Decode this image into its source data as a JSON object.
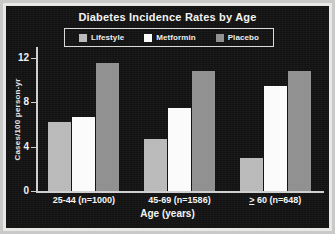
{
  "chart_data": {
    "type": "bar",
    "title": "Diabetes Incidence Rates by Age",
    "xlabel": "Age (years)",
    "ylabel": "Cases/100 person-yr",
    "categories": [
      "25-44 (n=1000)",
      "45-69 (n=1586)",
      "> 60 (n=648)"
    ],
    "series": [
      {
        "name": "Lifestyle",
        "color": "#b9b9b9",
        "values": [
          6.2,
          4.7,
          3.0
        ]
      },
      {
        "name": "Metformin",
        "color": "#fbfbfb",
        "values": [
          6.7,
          7.5,
          9.5
        ]
      },
      {
        "name": "Placebo",
        "color": "#8f8f8f",
        "values": [
          11.6,
          10.8,
          10.8
        ]
      }
    ],
    "ylim": [
      0,
      13
    ],
    "yticks": [
      0,
      4,
      8,
      12
    ],
    "ytick_labels": [
      "0",
      "4",
      "8",
      "12"
    ],
    "grid": false,
    "legend_position": "top-center",
    "background_color": "#121212",
    "foreground_color": "#f0f0f0"
  },
  "legend": {
    "items": [
      {
        "label": "Lifestyle"
      },
      {
        "label": "Metformin"
      },
      {
        "label": "Placebo"
      }
    ]
  },
  "axis": {
    "y_tick_0": "0",
    "y_tick_1": "4",
    "y_tick_2": "8",
    "y_tick_3": "12"
  },
  "groups": [
    {
      "label": "25-44 (n=1000)",
      "prefix": "",
      "rest": "25-44 (n=1000)"
    },
    {
      "label": "45-69 (n=1586)",
      "prefix": "",
      "rest": "45-69 (n=1586)"
    },
    {
      "label": "> 60 (n=648)",
      "prefix": ">",
      "rest": " 60 (n=648)"
    }
  ]
}
